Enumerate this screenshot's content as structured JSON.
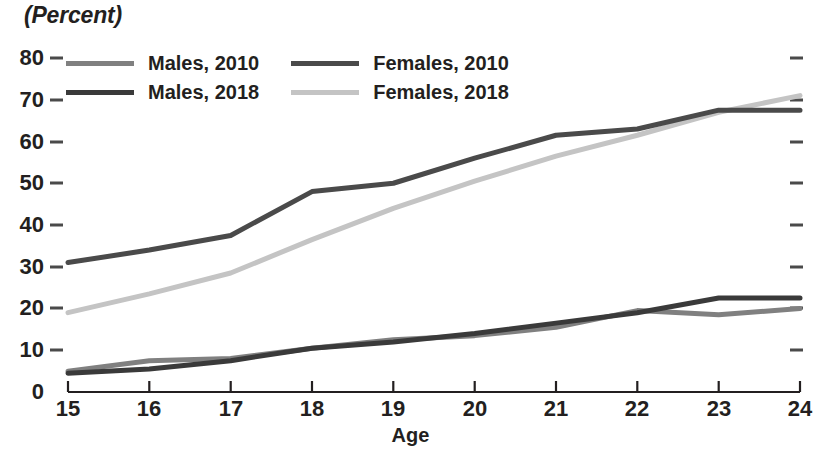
{
  "chart_data": {
    "type": "line",
    "title": "",
    "ylabel": "(Percent)",
    "xlabel": "Age",
    "x": [
      15,
      16,
      17,
      18,
      19,
      20,
      21,
      22,
      23,
      24
    ],
    "xtick_labels": [
      "15",
      "16",
      "17",
      "18",
      "19",
      "20",
      "21",
      "22",
      "23",
      "24"
    ],
    "ytick_labels": [
      "0",
      "10",
      "20",
      "30",
      "40",
      "50",
      "60",
      "70",
      "80"
    ],
    "ylim": [
      0,
      80
    ],
    "xlim": [
      15,
      24
    ],
    "grid": false,
    "legend_position": "top-left",
    "series": [
      {
        "name": "Males, 2010",
        "color": "#808080",
        "values": [
          5.0,
          7.5,
          8.0,
          10.5,
          12.5,
          13.5,
          15.5,
          19.5,
          18.5,
          20.0
        ]
      },
      {
        "name": "Males, 2018",
        "color": "#3a3a3a",
        "values": [
          4.5,
          5.5,
          7.5,
          10.5,
          12.0,
          14.0,
          16.5,
          19.0,
          22.5,
          22.5
        ]
      },
      {
        "name": "Females, 2010",
        "color": "#4a4a4a",
        "values": [
          31.0,
          34.0,
          37.5,
          48.0,
          50.0,
          56.0,
          61.5,
          63.0,
          67.5,
          67.5
        ]
      },
      {
        "name": "Females, 2018",
        "color": "#c4c4c4",
        "values": [
          19.0,
          23.5,
          28.5,
          36.5,
          44.0,
          50.5,
          56.5,
          61.5,
          67.0,
          71.0
        ]
      }
    ]
  },
  "legend": {
    "entries": [
      {
        "label": "Males, 2010",
        "color": "#808080"
      },
      {
        "label": "Females, 2010",
        "color": "#4a4a4a"
      },
      {
        "label": "Males, 2018",
        "color": "#3a3a3a"
      },
      {
        "label": "Females, 2018",
        "color": "#c4c4c4"
      }
    ]
  },
  "axes": {
    "y_title": "(Percent)",
    "x_title": "Age"
  }
}
